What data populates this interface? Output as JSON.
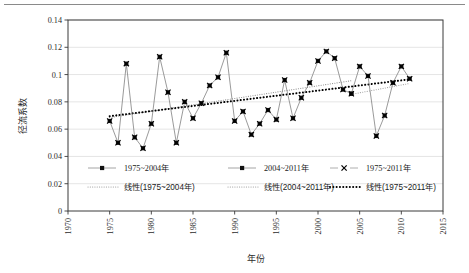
{
  "chart_data": {
    "type": "line",
    "title": "",
    "xlabel": "年份",
    "ylabel": "径流系数",
    "xlim": [
      1970,
      2015
    ],
    "ylim": [
      0,
      0.14
    ],
    "xticks": [
      1970,
      1975,
      1980,
      1985,
      1990,
      1995,
      2000,
      2005,
      2010,
      2015
    ],
    "xtick_labels": [
      "1970",
      "1975",
      "1980",
      "1985",
      "1990",
      "1995",
      "2000",
      "2005",
      "2010",
      "2015"
    ],
    "yticks": [
      0,
      0.02,
      0.04,
      0.06,
      0.08,
      0.1,
      0.12,
      0.14
    ],
    "ytick_labels": [
      "0",
      "0.02",
      "0.04",
      "0.06",
      "0.08",
      "0.1",
      "0.12",
      "0.14"
    ],
    "grid": "horizontal",
    "legend_position": "inside-bottom",
    "x": [
      1975,
      1976,
      1977,
      1978,
      1979,
      1980,
      1981,
      1982,
      1983,
      1984,
      1985,
      1986,
      1987,
      1988,
      1989,
      1990,
      1991,
      1992,
      1993,
      1994,
      1995,
      1996,
      1997,
      1998,
      1999,
      2000,
      2001,
      2002,
      2003,
      2004,
      2005,
      2006,
      2007,
      2008,
      2009,
      2010,
      2011
    ],
    "series": [
      {
        "name": "1975~2004年",
        "marker": "circle",
        "color": "#808080",
        "x": [
          1975,
          1976,
          1977,
          1978,
          1979,
          1980,
          1981,
          1982,
          1983,
          1984,
          1985,
          1986,
          1987,
          1988,
          1989,
          1990,
          1991,
          1992,
          1993,
          1994,
          1995,
          1996,
          1997,
          1998,
          1999,
          2000,
          2001,
          2002,
          2003,
          2004
        ],
        "values": [
          0.066,
          0.05,
          0.108,
          0.054,
          0.046,
          0.064,
          0.113,
          0.087,
          0.05,
          0.08,
          0.068,
          0.079,
          0.092,
          0.098,
          0.116,
          0.066,
          0.073,
          0.056,
          0.064,
          0.074,
          0.067,
          0.096,
          0.068,
          0.083,
          0.094,
          0.11,
          0.117,
          0.112,
          0.089,
          0.086
        ]
      },
      {
        "name": "2004~2011年",
        "marker": "circle",
        "color": "#808080",
        "x": [
          2004,
          2005,
          2006,
          2007,
          2008,
          2009,
          2010,
          2011
        ],
        "values": [
          0.086,
          0.106,
          0.099,
          0.055,
          0.07,
          0.094,
          0.106,
          0.097
        ]
      },
      {
        "name": "1975~2011年",
        "marker": "x",
        "color": "#000000",
        "x": [
          1975,
          1976,
          1977,
          1978,
          1979,
          1980,
          1981,
          1982,
          1983,
          1984,
          1985,
          1986,
          1987,
          1988,
          1989,
          1990,
          1991,
          1992,
          1993,
          1994,
          1995,
          1996,
          1997,
          1998,
          1999,
          2000,
          2001,
          2002,
          2003,
          2004,
          2005,
          2006,
          2007,
          2008,
          2009,
          2010,
          2011
        ],
        "values": [
          0.066,
          0.05,
          0.108,
          0.054,
          0.046,
          0.064,
          0.113,
          0.087,
          0.05,
          0.08,
          0.068,
          0.079,
          0.092,
          0.098,
          0.116,
          0.066,
          0.073,
          0.056,
          0.064,
          0.074,
          0.067,
          0.096,
          0.068,
          0.083,
          0.094,
          0.11,
          0.117,
          0.112,
          0.089,
          0.086,
          0.106,
          0.099,
          0.055,
          0.07,
          0.094,
          0.106,
          0.097
        ]
      }
    ],
    "trendlines": [
      {
        "name": "线性(1975~2004年)",
        "style": "dotted-fine",
        "color": "#8c8c8c",
        "x_start": 1975,
        "x_end": 2004,
        "y_start": 0.0685,
        "y_end": 0.0955
      },
      {
        "name": "线性(2004~2011年)",
        "style": "dotted-fine",
        "color": "#a0a0a0",
        "x_start": 2004,
        "x_end": 2011,
        "y_start": 0.0855,
        "y_end": 0.0935
      },
      {
        "name": "线性(1975~2011年)",
        "style": "dotted-bold",
        "color": "#000000",
        "x_start": 1975,
        "x_end": 2011,
        "y_start": 0.0695,
        "y_end": 0.0965
      }
    ]
  },
  "legend": {
    "row1": [
      {
        "label": "1975~2004年",
        "marker": "circle-line"
      },
      {
        "label": "2004~2011年",
        "marker": "circle-line"
      },
      {
        "label": "1975~2011年",
        "marker": "x-mark"
      }
    ],
    "row2": [
      {
        "label": "线性(1975~2004年)",
        "marker": "dotted-fine"
      },
      {
        "label": "线性(2004~2011年)",
        "marker": "dotted-fine"
      },
      {
        "label": "线性(1975~2011年)",
        "marker": "dotted-bold"
      }
    ]
  },
  "colors": {
    "axis": "#3a3a3a",
    "grid": "#d9d9d9",
    "series_gray": "#808080",
    "series_black": "#000000",
    "background": "#ffffff"
  }
}
